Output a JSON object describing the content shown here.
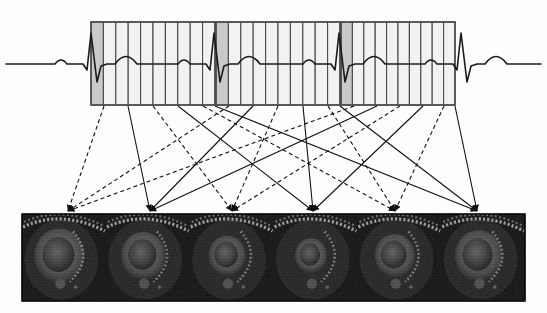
{
  "figure": {
    "background_color": "#fdfdfc",
    "ink_color": "#1a1a1a"
  },
  "ecg": {
    "name": "electrocardiogram-trace",
    "stroke_color": "#1a1a1a",
    "stroke_width": 1.6,
    "baseline_y": 64,
    "start_x": 6,
    "end_x": 541,
    "beats": 4,
    "wave_labels": [
      "P",
      "QRS",
      "T"
    ],
    "r_peak_positions": [
      93,
      216,
      341,
      463
    ]
  },
  "segment_boxes": {
    "name": "cardiac-cycle-segment-boxes",
    "count": 3,
    "columns_per_box": 10,
    "top_y": 22,
    "bottom_y": 105,
    "border_color": "#4a4a4a",
    "border_width": 1.1,
    "cell_fill": "#f2f2f0",
    "highlight_fill": "#c9c9c9",
    "boxes": [
      {
        "label": "cycle-1",
        "x": 91,
        "width": 124,
        "highlight_column": 0
      },
      {
        "label": "cycle-2",
        "x": 216,
        "width": 124,
        "highlight_column": 0
      },
      {
        "label": "cycle-3",
        "x": 341,
        "width": 114,
        "highlight_column": 0
      }
    ]
  },
  "mapping_arrows": {
    "name": "bin-to-frame-mapping-arrows",
    "solid_color": "#111111",
    "dashed_color": "#111111",
    "dash_pattern": "4,3",
    "stroke_width": 1.1,
    "arrow_target_y": 211,
    "arrow_source_y": 106,
    "targets_x": [
      68,
      150,
      232,
      313,
      395,
      477
    ],
    "links": [
      {
        "from_x": 104,
        "to_frame": 0,
        "style": "dashed"
      },
      {
        "from_x": 128,
        "to_frame": 1,
        "style": "solid"
      },
      {
        "from_x": 153,
        "to_frame": 2,
        "style": "dashed"
      },
      {
        "from_x": 178,
        "to_frame": 3,
        "style": "solid"
      },
      {
        "from_x": 203,
        "to_frame": 4,
        "style": "dashed"
      },
      {
        "from_x": 215,
        "to_frame": 5,
        "style": "solid"
      },
      {
        "from_x": 229,
        "to_frame": 0,
        "style": "dashed"
      },
      {
        "from_x": 253,
        "to_frame": 1,
        "style": "solid"
      },
      {
        "from_x": 278,
        "to_frame": 2,
        "style": "dashed"
      },
      {
        "from_x": 303,
        "to_frame": 3,
        "style": "solid"
      },
      {
        "from_x": 328,
        "to_frame": 4,
        "style": "dashed"
      },
      {
        "from_x": 340,
        "to_frame": 5,
        "style": "solid"
      },
      {
        "from_x": 354,
        "to_frame": 0,
        "style": "dashed"
      },
      {
        "from_x": 377,
        "to_frame": 1,
        "style": "solid"
      },
      {
        "from_x": 400,
        "to_frame": 2,
        "style": "dashed"
      },
      {
        "from_x": 423,
        "to_frame": 3,
        "style": "solid"
      },
      {
        "from_x": 444,
        "to_frame": 4,
        "style": "dashed"
      },
      {
        "from_x": 455,
        "to_frame": 5,
        "style": "solid"
      }
    ]
  },
  "image_strip": {
    "name": "cardiac-cine-frame-strip",
    "x": 22,
    "y": 214,
    "width": 503,
    "height": 87,
    "frame_count": 6,
    "background_color": "#0a0a0a",
    "border_color": "#000000",
    "frames": [
      {
        "label": "frame-1",
        "phase": "end-diastole"
      },
      {
        "label": "frame-2",
        "phase": "early-systole"
      },
      {
        "label": "frame-3",
        "phase": "mid-systole"
      },
      {
        "label": "frame-4",
        "phase": "end-systole"
      },
      {
        "label": "frame-5",
        "phase": "early-diastole"
      },
      {
        "label": "frame-6",
        "phase": "mid-diastole"
      }
    ]
  }
}
